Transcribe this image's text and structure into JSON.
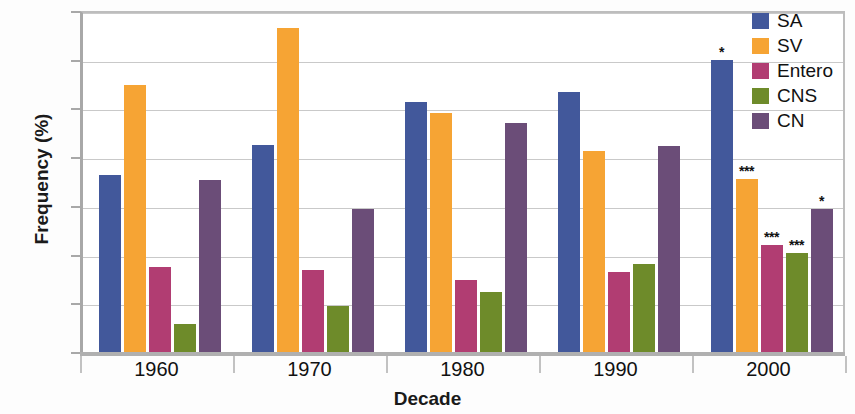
{
  "chart_data": {
    "type": "bar",
    "title": "",
    "xlabel": "Decade",
    "ylabel": "Frequency (%)",
    "categories": [
      "1960",
      "1970",
      "1980",
      "1990",
      "2000"
    ],
    "ylim": [
      0,
      35
    ],
    "yticks": [
      0,
      5,
      10,
      15,
      20,
      25,
      30,
      35
    ],
    "grid": true,
    "legend_position": "top-right",
    "series": [
      {
        "name": "SA",
        "color": "#42589b",
        "values": [
          18.2,
          21.2,
          25.7,
          26.7,
          30.0
        ],
        "annotations": [
          "",
          "",
          "",
          "",
          "*"
        ]
      },
      {
        "name": "SV",
        "color": "#f6a434",
        "values": [
          27.4,
          33.3,
          24.5,
          20.6,
          17.8
        ],
        "annotations": [
          "",
          "",
          "",
          "",
          "***"
        ]
      },
      {
        "name": "Entero",
        "color": "#b13d72",
        "values": [
          8.7,
          8.4,
          7.4,
          8.2,
          11.0
        ],
        "annotations": [
          "",
          "",
          "",
          "",
          "***"
        ]
      },
      {
        "name": "CNS",
        "color": "#6e8b2a",
        "values": [
          2.9,
          4.7,
          6.2,
          9.0,
          10.2
        ],
        "annotations": [
          "",
          "",
          "",
          "",
          "***"
        ]
      },
      {
        "name": "CN",
        "color": "#6b4d78",
        "values": [
          17.7,
          14.7,
          23.5,
          21.1,
          14.7
        ],
        "annotations": [
          "",
          "",
          "",
          "",
          "*"
        ]
      }
    ]
  }
}
